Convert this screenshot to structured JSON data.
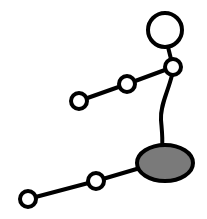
{
  "diagram": {
    "type": "stick-figure",
    "colors": {
      "stroke": "#000000",
      "joint_fill": "#ffffff",
      "hip_fill": "#7a7a7a",
      "background": "#ffffff"
    },
    "stroke_width": 4,
    "nodes": {
      "head": {
        "cx": 165,
        "cy": 30,
        "r": 17
      },
      "shoulder": {
        "cx": 173,
        "cy": 67,
        "r": 8
      },
      "elbow": {
        "cx": 127,
        "cy": 84,
        "r": 8
      },
      "hand": {
        "cx": 79,
        "cy": 101,
        "r": 8
      },
      "hip": {
        "cx": 165,
        "cy": 163,
        "rx": 28,
        "ry": 18
      },
      "knee": {
        "cx": 96,
        "cy": 181,
        "r": 8
      },
      "foot": {
        "cx": 28,
        "cy": 199,
        "r": 8
      }
    },
    "labels": {
      "head": "head",
      "shoulder": "shoulder",
      "elbow": "elbow",
      "hand": "hand",
      "hip": "hip",
      "knee": "knee",
      "foot": "foot"
    }
  }
}
